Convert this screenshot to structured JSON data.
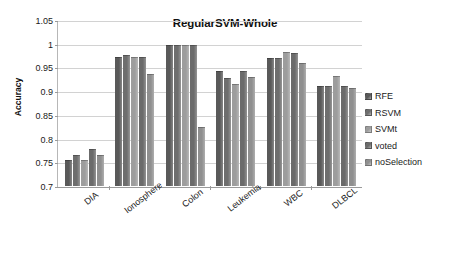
{
  "chart_data": {
    "type": "bar",
    "title": "RegularSVM-Whole",
    "xlabel": "",
    "ylabel": "Accuracy",
    "ylim": [
      0.7,
      1.05
    ],
    "yticks": [
      "0.7",
      "0.75",
      "0.8",
      "0.85",
      "0.9",
      "0.95",
      "1",
      "1.05"
    ],
    "ytick_values": [
      0.7,
      0.75,
      0.8,
      0.85,
      0.9,
      0.95,
      1.0,
      1.05
    ],
    "grid": true,
    "legend_position": "right",
    "categories": [
      "DIA",
      "Ionosphere",
      "Colon",
      "Leukemia",
      "WBC",
      "DLBCL"
    ],
    "series": [
      {
        "name": "RFE",
        "color": "#595959",
        "values": [
          0.755,
          0.973,
          1.0,
          0.944,
          0.971,
          0.912
        ]
      },
      {
        "name": "RSVM",
        "color": "#6e6e6e",
        "values": [
          0.765,
          0.977,
          1.0,
          0.93,
          0.972,
          0.913
        ]
      },
      {
        "name": "SVMt",
        "color": "#9d9d9d",
        "values": [
          0.755,
          0.973,
          1.0,
          0.916,
          0.984,
          0.934
        ]
      },
      {
        "name": "voted",
        "color": "#6b6b6b",
        "values": [
          0.778,
          0.974,
          1.0,
          0.944,
          0.982,
          0.913
        ]
      },
      {
        "name": "noSelection",
        "color": "#8f8f8f",
        "values": [
          0.765,
          0.937,
          0.825,
          0.932,
          0.961,
          0.907
        ]
      }
    ]
  }
}
